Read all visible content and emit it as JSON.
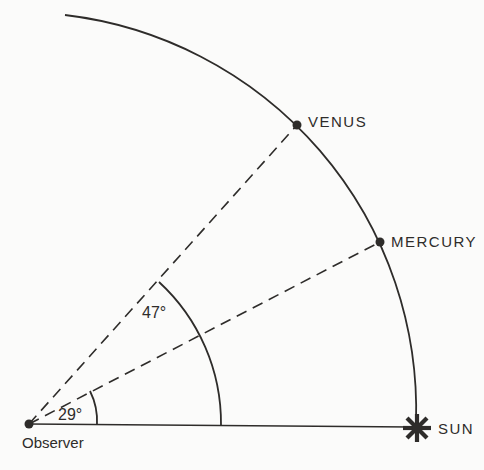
{
  "colors": {
    "ink": "#2e2c2a",
    "background": "#fbfbfa"
  },
  "labels": {
    "venus": "VENUS",
    "mercury": "MERCURY",
    "sun": "SUN",
    "observer": "Observer",
    "venus_elongation": "47°",
    "mercury_elongation": "29°"
  },
  "diagram": {
    "type": "geometry",
    "angles_deg": {
      "venus_elongation": 47,
      "mercury_elongation": 29
    }
  }
}
